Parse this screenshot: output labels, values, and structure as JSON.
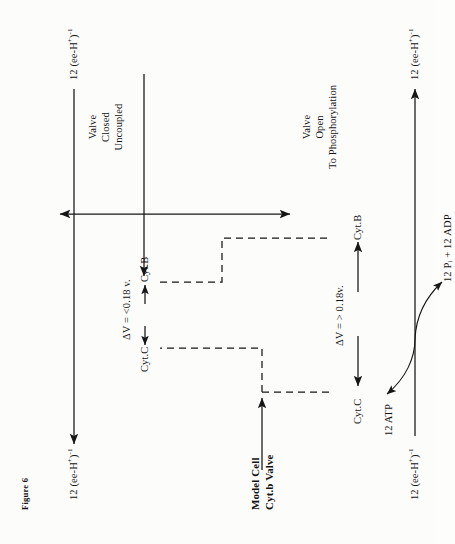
{
  "figure": {
    "number": "Figure 6",
    "title_line1": "Model Cell",
    "title_line2": "Cyt.b Valve"
  },
  "labels": {
    "electron_flux_in": "12 (ee-H",
    "top_left_flux": "12 (ee-H+)-1",
    "top_right_flux": "12 (ee-H+)-1",
    "bottom_left_flux": "12 (ee-H+)-1",
    "bottom_right_flux": "12 (ee-H+)-1",
    "atp": "12 ATP",
    "pi_adp": "12 Pi + 12 ADP",
    "cyt_c_upper": "Cyt.C",
    "cyt_b_upper": "Cyt.B",
    "cyt_c_lower": "Cyt.C",
    "cyt_b_lower": "Cyt.B",
    "delta_v_upper": "ΔV = <0.18 v.",
    "delta_v_lower": "ΔV  = > 0.18v.",
    "state_closed_l1": "Valve",
    "state_closed_l2": "Closed",
    "state_closed_l3": "Uncoupled",
    "state_open_l1": "Valve",
    "state_open_l2": "Open",
    "state_open_l3": "To Phosphorylation"
  },
  "flux_parts": {
    "prefix": "12 (ee-H",
    "sup_plus": "+",
    "mid": ")",
    "sup_inv": "-1"
  },
  "colors": {
    "ink": "#161616",
    "paper": "#fcfcfb"
  }
}
